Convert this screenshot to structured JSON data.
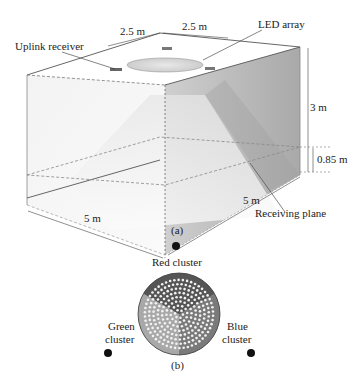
{
  "figure_a": {
    "caption": "(a)",
    "labels": {
      "uplink_receiver": "Uplink receiver",
      "led_array": "LED array",
      "receiving_plane": "Receiving plane"
    },
    "dimensions": {
      "top_left": "2.5 m",
      "top_right": "2.5 m",
      "height": "3 m",
      "plane_height": "0.85 m",
      "front_width": "5 m",
      "depth": "5 m"
    }
  },
  "figure_b": {
    "caption": "(b)",
    "clusters": {
      "red": "Red cluster",
      "green_line1": "Green",
      "green_line2": "cluster",
      "blue_line1": "Blue",
      "blue_line2": "cluster"
    }
  }
}
